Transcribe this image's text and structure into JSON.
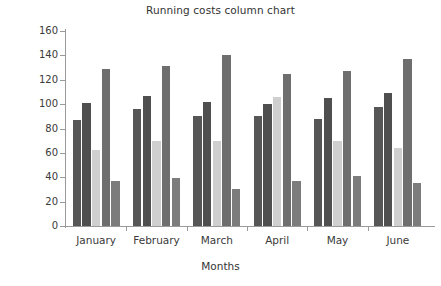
{
  "chart_data": {
    "type": "bar",
    "title": "Running costs column chart",
    "xlabel": "Months",
    "ylabel": "Costs",
    "categories": [
      "January",
      "February",
      "March",
      "April",
      "May",
      "June"
    ],
    "ylim": [
      0,
      160
    ],
    "yticks": [
      0,
      20,
      40,
      60,
      80,
      100,
      120,
      140,
      160
    ],
    "ytick_labels": [
      "0",
      "20",
      "40",
      "60",
      "80",
      "100",
      "120",
      "140",
      "160"
    ],
    "grid": false,
    "legend": "none",
    "series": [
      {
        "name": "Series 1",
        "color": "#565656",
        "values": [
          87,
          96,
          90,
          90,
          88,
          98
        ]
      },
      {
        "name": "Series 2",
        "color": "#4f4f4f",
        "values": [
          101,
          107,
          102,
          100,
          105,
          109
        ]
      },
      {
        "name": "Series 3",
        "color": "#cfcfcf",
        "values": [
          62,
          70,
          70,
          106,
          70,
          64
        ]
      },
      {
        "name": "Series 4",
        "color": "#6e6e6e",
        "values": [
          129,
          131,
          140,
          125,
          127,
          137
        ]
      },
      {
        "name": "Series 5",
        "color": "#7c7c7c",
        "values": [
          37,
          39,
          30,
          37,
          41,
          35
        ]
      }
    ]
  }
}
